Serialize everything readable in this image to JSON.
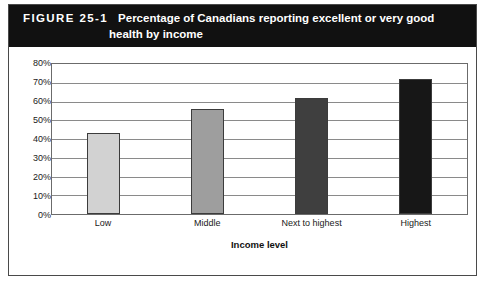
{
  "figure": {
    "number_label": "FIGURE 25-1",
    "title_line1": "Percentage of Canadians reporting excellent or very good",
    "title_line2": "health by income",
    "header_bg": "#111111",
    "header_fg": "#ffffff"
  },
  "chart_data": {
    "type": "bar",
    "title": "Percentage of Canadians reporting excellent or very good health by income",
    "categories": [
      "Low",
      "Middle",
      "Next to highest",
      "Highest"
    ],
    "values": [
      43,
      56,
      62,
      72
    ],
    "xlabel": "Income level",
    "ylabel": "",
    "ylim": [
      0,
      80
    ],
    "ytick_step": 10,
    "ytick_labels": [
      "80%",
      "70%",
      "60%",
      "50%",
      "40%",
      "30%",
      "20%",
      "10%",
      "0%"
    ],
    "ytick_values": [
      80,
      70,
      60,
      50,
      40,
      30,
      20,
      10,
      0
    ],
    "grid": true,
    "legend": false,
    "bar_colors": [
      "#d2d2d2",
      "#9e9e9e",
      "#3f3f3f",
      "#171717"
    ],
    "bar_border_color": "#3c3c3c"
  }
}
